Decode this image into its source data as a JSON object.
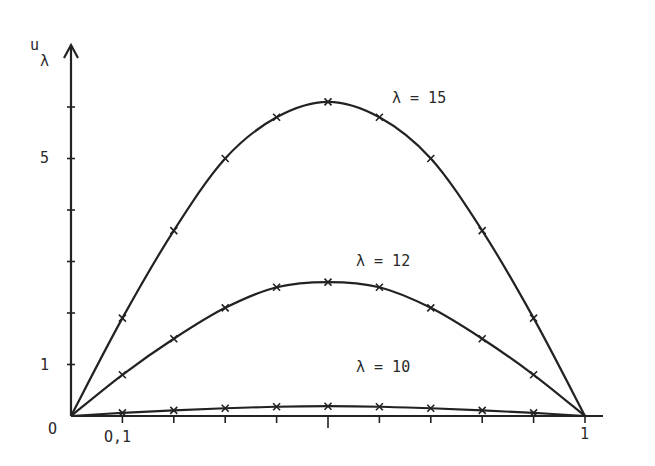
{
  "chart_data": {
    "type": "line",
    "title": "",
    "xlabel": "",
    "ylabel": "u_λ",
    "xlim": [
      0,
      1
    ],
    "ylim": [
      0,
      6.5
    ],
    "grid": false,
    "x_tick_labels": [
      "0",
      "0,1",
      "1"
    ],
    "y_tick_labels": [
      "1",
      "5"
    ],
    "x_ticks": [
      0.1,
      0.2,
      0.3,
      0.4,
      0.5,
      0.6,
      0.7,
      0.8,
      0.9,
      1.0
    ],
    "y_ticks": [
      1,
      2,
      3,
      4,
      5,
      6
    ],
    "x": [
      0,
      0.1,
      0.2,
      0.3,
      0.4,
      0.5,
      0.6,
      0.7,
      0.8,
      0.9,
      1.0
    ],
    "series": [
      {
        "name": "λ = 15",
        "values": [
          0,
          1.9,
          3.6,
          5.0,
          5.8,
          6.1,
          5.8,
          5.0,
          3.6,
          1.9,
          0
        ]
      },
      {
        "name": "λ = 12",
        "values": [
          0,
          0.8,
          1.5,
          2.1,
          2.5,
          2.6,
          2.5,
          2.1,
          1.5,
          0.8,
          0
        ]
      },
      {
        "name": "λ = 10",
        "values": [
          0,
          0.06,
          0.11,
          0.15,
          0.18,
          0.19,
          0.18,
          0.15,
          0.11,
          0.06,
          0
        ]
      }
    ],
    "annotations": [
      "λ = 15",
      "λ = 12",
      "λ = 10"
    ],
    "markers": "x"
  },
  "labels": {
    "y_axis": "u",
    "y_axis_sub": "λ",
    "origin": "O",
    "x_tick_01": "O,1",
    "x_tick_1": "1",
    "y_tick_1": "1",
    "y_tick_5": "5",
    "curve_15": "λ = 15",
    "curve_12": "λ = 12",
    "curve_10": "λ = 10"
  }
}
